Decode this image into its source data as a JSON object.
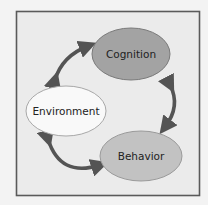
{
  "diagram": {
    "type": "cycle",
    "nodes": [
      {
        "id": "cognition",
        "label": "Cognition",
        "fill": "#a3a3a3"
      },
      {
        "id": "environment",
        "label": "Environment",
        "fill": "#f9f9f9"
      },
      {
        "id": "behavior",
        "label": "Behavior",
        "fill": "#c2c2c2"
      }
    ],
    "edges": [
      {
        "from": "environment",
        "to": "cognition",
        "bidirectional": true
      },
      {
        "from": "cognition",
        "to": "behavior",
        "bidirectional": true
      },
      {
        "from": "behavior",
        "to": "environment",
        "bidirectional": true
      }
    ],
    "colors": {
      "background": "#f3f3f3",
      "frame_fill": "#ebebeb",
      "frame_border": "#5a5a5a",
      "arrow": "#545454"
    }
  }
}
